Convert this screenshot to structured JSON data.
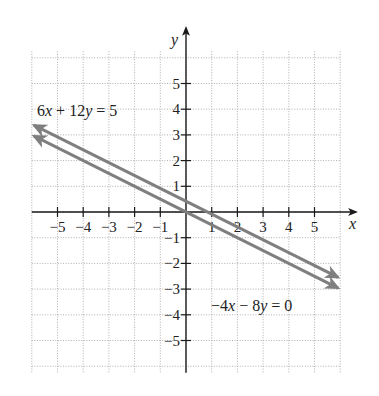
{
  "chart_data": {
    "type": "line",
    "title": "",
    "xlabel": "x",
    "ylabel": "y",
    "xlim": [
      -6,
      6
    ],
    "ylim": [
      -6.2,
      6.2
    ],
    "grid": true,
    "x_ticks": [
      -5,
      -4,
      -3,
      -2,
      -1,
      1,
      2,
      3,
      4,
      5
    ],
    "x_tick_labels": [
      "−5",
      "−4",
      "−3",
      "−2",
      "−1",
      "1",
      "2",
      "3",
      "4",
      "5"
    ],
    "y_ticks": [
      5,
      4,
      3,
      2,
      1,
      -1,
      -2,
      -3,
      -4,
      -5
    ],
    "y_tick_labels": [
      "5",
      "4",
      "3",
      "2",
      "1",
      "−1",
      "−2",
      "−3",
      "−4",
      "−5"
    ],
    "series": [
      {
        "name": "6x + 12y = 5",
        "equation": "6x + 12y = 5",
        "slope": -0.5,
        "intercept": 0.4167,
        "x": [
          -6,
          6
        ],
        "y": [
          3.417,
          -2.583
        ],
        "color": "#7f7f7f",
        "arrows": "both"
      },
      {
        "name": "-4x - 8y = 0",
        "equation": "−4x − 8y = 0",
        "slope": -0.5,
        "intercept": 0,
        "x": [
          -6,
          6
        ],
        "y": [
          3,
          -3
        ],
        "color": "#7f7f7f",
        "arrows": "both"
      }
    ],
    "annotations": [
      {
        "text": "6x + 12y = 5",
        "near": [
          -4.2,
          4
        ]
      },
      {
        "text": "−4x − 8y = 0",
        "near": [
          2.9,
          -3.2
        ]
      }
    ]
  },
  "labels": {
    "x_axis": "x",
    "y_axis": "y",
    "eq1": {
      "a": "6",
      "v1": "x",
      "mid": " + 12",
      "v2": "y",
      "rhs": " = 5"
    },
    "eq2": {
      "a": "−4",
      "v1": "x",
      "mid": " − 8",
      "v2": "y",
      "rhs": " = 0"
    }
  },
  "colors": {
    "line": "#7f7f7f",
    "axis": "#1a1a1a",
    "grid": "#9a9a9a"
  }
}
